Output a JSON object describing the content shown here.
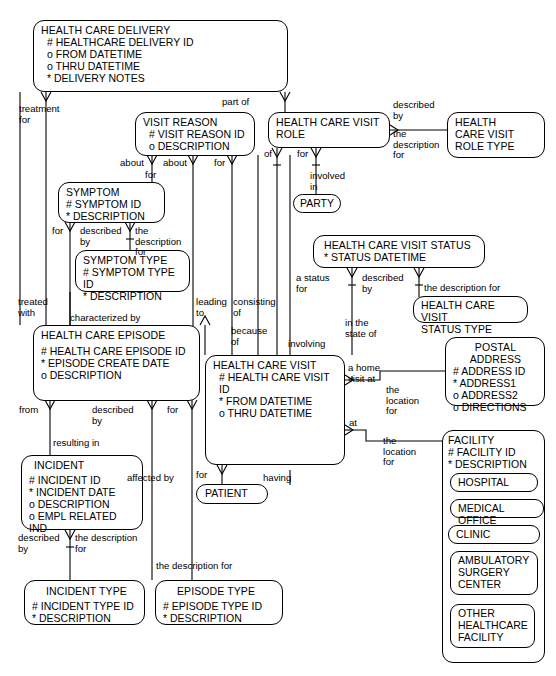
{
  "diagram": {
    "type": "entity-relationship-diagram",
    "notation": "Barker / Oracle CASE (crow's foot)"
  },
  "entities": {
    "health_care_delivery": {
      "name": "HEALTH CARE DELIVERY",
      "attributes": "# HEALTHCARE DELIVERY ID\no FROM DATETIME\no THRU DATETIME\n* DELIVERY NOTES"
    },
    "visit_reason": {
      "name": "VISIT REASON",
      "attributes": "# VISIT REASON ID\no  DESCRIPTION"
    },
    "health_care_visit_role": {
      "name": "HEALTH CARE VISIT\nROLE",
      "attributes": ""
    },
    "health_care_visit_role_type": {
      "name": "HEALTH\nCARE VISIT\nROLE TYPE",
      "attributes": ""
    },
    "party": {
      "name": "PARTY"
    },
    "symptom": {
      "name": "SYMPTOM",
      "attributes": "# SYMPTOM ID\n* DESCRIPTION"
    },
    "symptom_type": {
      "name": "SYMPTOM TYPE",
      "attributes": "# SYMPTOM TYPE ID\n* DESCRIPTION"
    },
    "health_care_visit_status": {
      "name": "HEALTH CARE VISIT STATUS",
      "attributes": "* STATUS  DATETIME"
    },
    "health_care_visit_status_type": {
      "name": "HEALTH CARE VISIT\nSTATUS TYPE",
      "attributes": ""
    },
    "health_care_episode": {
      "name": "HEALTH CARE EPISODE",
      "attributes": "# HEALTH CARE EPISODE ID\n* EPISODE CREATE DATE\no DESCRIPTION"
    },
    "health_care_visit": {
      "name": "HEALTH CARE VISIT",
      "attributes": "# HEALTH CARE VISIT ID\n* FROM DATETIME\no THRU DATETIME"
    },
    "postal_address": {
      "name": "POSTAL\nADDRESS",
      "attributes": "#  ADDRESS ID\n*  ADDRESS1\no  ADDRESS2\no  DIRECTIONS"
    },
    "facility": {
      "name": "FACILITY",
      "attributes": "# FACILITY ID\n* DESCRIPTION",
      "subtypes": [
        "HOSPITAL",
        "MEDICAL OFFICE",
        "CLINIC",
        "AMBULATORY\nSURGERY\nCENTER",
        "OTHER\nHEALTHCARE\nFACILITY"
      ]
    },
    "incident": {
      "name": "INCIDENT",
      "attributes": "# INCIDENT ID\n* INCIDENT DATE\no DESCRIPTION\no EMPL RELATED IND"
    },
    "patient": {
      "name": "PATIENT"
    },
    "incident_type": {
      "name": "INCIDENT TYPE",
      "attributes": "# INCIDENT TYPE ID\n* DESCRIPTION"
    },
    "episode_type": {
      "name": "EPISODE TYPE",
      "attributes": "# EPISODE TYPE ID\n* DESCRIPTION"
    }
  },
  "relationship_labels": {
    "treatment_for": "treatment\nfor",
    "part_of": "part of",
    "described_by_role": "described\nby",
    "the_description_for_role": "the\ndescription\nfor",
    "about_left": "about",
    "about_right": "about",
    "for_reason": "for",
    "for_role": "for",
    "of_role": "of",
    "for_party": "for",
    "involved_in": "involved\nin",
    "for_symptom": "for",
    "described_by_symptom": "described\nby",
    "the_description_for_symptom": "the\ndescription\nfor",
    "treated_with": "treated\nwith",
    "characterized_by": "characterized by",
    "leading_to": "leading\nto",
    "consisting_of": "consisting\nof",
    "because_of": "because\nof",
    "a_status_for": "a status\nfor",
    "described_by_status": "described\nby",
    "the_description_for_status": "the description for",
    "in_the_state_of": "in the\nstate of",
    "involving": "involving",
    "a_home_visit_at": "a home\nvisit at",
    "the_location_for_address": "the\nlocation\nfor",
    "at_facility": "at",
    "the_location_for_facility": "the\nlocation\nfor",
    "from_incident": "from",
    "described_by_episode": "described\nby",
    "resulting_in": "resulting in",
    "for_episode_type": "for",
    "described_by_incident": "described\nby",
    "the_description_for_incident": "the description\nfor",
    "the_description_for_episode": "the description for",
    "for_patient": "for",
    "affected_by": "affected by",
    "having": "having"
  },
  "colors": {
    "stroke": "#000000",
    "background": "#ffffff"
  }
}
